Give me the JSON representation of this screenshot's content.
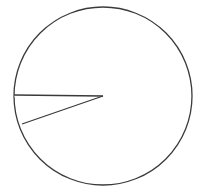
{
  "figure": {
    "kind": "geometry-diagram",
    "background_color": "#ffffff",
    "canvas": {
      "width": 202,
      "height": 195
    }
  },
  "chart_data": {
    "type": "pie",
    "title": "",
    "subtitle": "",
    "xlabel": "",
    "ylabel": "",
    "legend": [],
    "annotations": [],
    "grid": false,
    "categories": [
      "sector",
      "remainder"
    ],
    "values": [
      9.7,
      90.3
    ],
    "labels": [
      "",
      ""
    ],
    "units": "percent",
    "start_angle_deg": 180,
    "end_angle_deg": 215,
    "sweep_deg": 35
  },
  "geometry": {
    "center": {
      "x": 103,
      "y": 96
    },
    "radius": 89,
    "circle": {
      "stroke_color": "#3a3a3a",
      "stroke_width": 1.3,
      "fill_color": "#ffffff"
    },
    "sector": {
      "stroke_color": "#3a3a3a",
      "stroke_width": 1.3,
      "fill_color": "#ffffff",
      "apex": {
        "x": 103,
        "y": 96
      },
      "radius_1_endpoint": {
        "x": 14,
        "y": 95
      },
      "radius_2_endpoint": {
        "x": 22,
        "y": 124
      },
      "arc_start_angle_deg": 180,
      "arc_end_angle_deg": 215
    }
  },
  "colors": {
    "ink": "#3a3a3a",
    "paper": "#ffffff"
  }
}
